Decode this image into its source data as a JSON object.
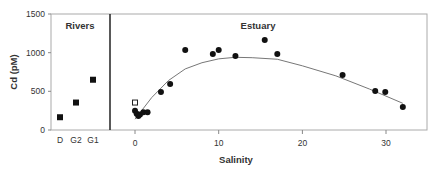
{
  "chart_data": {
    "type": "scatter",
    "ylabel": "Cd (pM)",
    "xlabel": "Salinity",
    "ylim": [
      0,
      1500
    ],
    "yticks": [
      "0",
      "500",
      "1000",
      "1500"
    ],
    "panels": [
      {
        "title": "Rivers",
        "categories": [
          "D",
          "G2",
          "G1"
        ],
        "values": [
          165,
          355,
          650
        ],
        "marker": "filled-square"
      },
      {
        "title": "Estuary",
        "xlim": [
          -3.5,
          34
        ],
        "xticks": [
          "0",
          "10",
          "20",
          "30"
        ],
        "series": [
          {
            "name": "filled-circles",
            "x": [
              0,
              0.2,
              0.4,
              0.6,
              1.0,
              1.5,
              3.1,
              4.2,
              6.0,
              9.3,
              10.0,
              12.0,
              15.5,
              17.0,
              24.8,
              28.7,
              29.9,
              32.0
            ],
            "y": [
              250,
              210,
              180,
              200,
              230,
              230,
              491,
              595,
              1034,
              983,
              1034,
              957,
              1164,
              983,
              711,
              504,
              491,
              297
            ]
          },
          {
            "name": "open-square",
            "x": [
              0
            ],
            "y": [
              355
            ]
          },
          {
            "name": "fit-curve",
            "x": [
              0,
              2,
              4,
              6,
              8,
              10,
              12,
              14,
              17,
              20,
              24,
              28,
              32
            ],
            "y": [
              140,
              420,
              640,
              790,
              870,
              920,
              940,
              935,
              915,
              830,
              700,
              530,
              345
            ]
          }
        ]
      }
    ]
  },
  "labels": {
    "rivers": "Rivers",
    "estuary": "Estuary",
    "ylabel": "Cd (pM)",
    "xlabel": "Salinity",
    "y0": "0",
    "y500": "500",
    "y1000": "1000",
    "y1500": "1500",
    "xD": "D",
    "xG2": "G2",
    "xG1": "G1",
    "x0": "0",
    "x10": "10",
    "x20": "20",
    "x30": "30"
  }
}
